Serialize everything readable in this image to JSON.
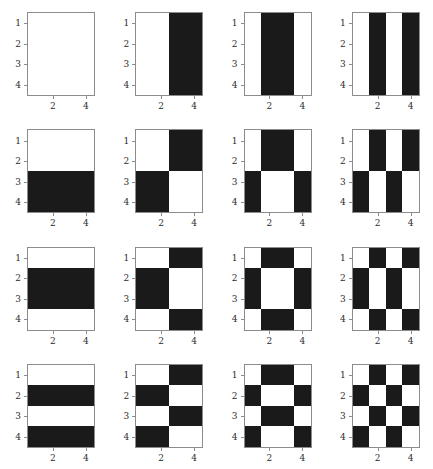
{
  "figure": {
    "title": "",
    "rows": 4,
    "cols": 4,
    "panel_count": 16,
    "colors": {
      "on": "#ffffff",
      "off": "#1a1a1a",
      "axis": "#8c8c8c",
      "text": "#2b2b2b",
      "background": "#ffffff"
    }
  },
  "axis": {
    "y_tick_values": [
      1,
      2,
      3,
      4
    ],
    "y_tick_labels": [
      "1",
      "2",
      "3",
      "4"
    ],
    "x_tick_values": [
      2,
      4
    ],
    "x_tick_labels": [
      "2",
      "4"
    ],
    "xlabel": "",
    "ylabel": "",
    "xlim": [
      0.5,
      4.5
    ],
    "ylim": [
      4.5,
      0.5
    ]
  },
  "chart_data": {
    "type": "heatmap",
    "title": "",
    "subtitle": "",
    "xlabel": "",
    "ylabel": "",
    "grid": false,
    "legend": null,
    "colormap": "binary (white = +1, black = -1)",
    "value_levels": [
      1,
      -1
    ],
    "row_index_labels": [
      "1",
      "2",
      "3",
      "4"
    ],
    "col_index_labels": [
      "1",
      "2",
      "3",
      "4"
    ],
    "basis_sequences": {
      "h1": [
        1,
        1,
        1,
        1
      ],
      "h2": [
        1,
        1,
        -1,
        -1
      ],
      "h3": [
        1,
        -1,
        -1,
        1
      ],
      "h4": [
        1,
        -1,
        1,
        -1
      ]
    },
    "panels": [
      {
        "row": 1,
        "col": 1,
        "row_sequence": [
          1,
          1,
          1,
          1
        ],
        "col_sequence": [
          1,
          1,
          1,
          1
        ],
        "matrix": [
          [
            1,
            1,
            1,
            1
          ],
          [
            1,
            1,
            1,
            1
          ],
          [
            1,
            1,
            1,
            1
          ],
          [
            1,
            1,
            1,
            1
          ]
        ]
      },
      {
        "row": 1,
        "col": 2,
        "row_sequence": [
          1,
          1,
          1,
          1
        ],
        "col_sequence": [
          1,
          1,
          -1,
          -1
        ],
        "matrix": [
          [
            1,
            1,
            -1,
            -1
          ],
          [
            1,
            1,
            -1,
            -1
          ],
          [
            1,
            1,
            -1,
            -1
          ],
          [
            1,
            1,
            -1,
            -1
          ]
        ]
      },
      {
        "row": 1,
        "col": 3,
        "row_sequence": [
          1,
          1,
          1,
          1
        ],
        "col_sequence": [
          1,
          -1,
          -1,
          1
        ],
        "matrix": [
          [
            1,
            -1,
            -1,
            1
          ],
          [
            1,
            -1,
            -1,
            1
          ],
          [
            1,
            -1,
            -1,
            1
          ],
          [
            1,
            -1,
            -1,
            1
          ]
        ]
      },
      {
        "row": 1,
        "col": 4,
        "row_sequence": [
          1,
          1,
          1,
          1
        ],
        "col_sequence": [
          1,
          -1,
          1,
          -1
        ],
        "matrix": [
          [
            1,
            -1,
            1,
            -1
          ],
          [
            1,
            -1,
            1,
            -1
          ],
          [
            1,
            -1,
            1,
            -1
          ],
          [
            1,
            -1,
            1,
            -1
          ]
        ]
      },
      {
        "row": 2,
        "col": 1,
        "row_sequence": [
          1,
          1,
          -1,
          -1
        ],
        "col_sequence": [
          1,
          1,
          1,
          1
        ],
        "matrix": [
          [
            1,
            1,
            1,
            1
          ],
          [
            1,
            1,
            1,
            1
          ],
          [
            -1,
            -1,
            -1,
            -1
          ],
          [
            -1,
            -1,
            -1,
            -1
          ]
        ]
      },
      {
        "row": 2,
        "col": 2,
        "row_sequence": [
          1,
          1,
          -1,
          -1
        ],
        "col_sequence": [
          1,
          1,
          -1,
          -1
        ],
        "matrix": [
          [
            1,
            1,
            -1,
            -1
          ],
          [
            1,
            1,
            -1,
            -1
          ],
          [
            -1,
            -1,
            1,
            1
          ],
          [
            -1,
            -1,
            1,
            1
          ]
        ]
      },
      {
        "row": 2,
        "col": 3,
        "row_sequence": [
          1,
          1,
          -1,
          -1
        ],
        "col_sequence": [
          1,
          -1,
          -1,
          1
        ],
        "matrix": [
          [
            1,
            -1,
            -1,
            1
          ],
          [
            1,
            -1,
            -1,
            1
          ],
          [
            -1,
            1,
            1,
            -1
          ],
          [
            -1,
            1,
            1,
            -1
          ]
        ]
      },
      {
        "row": 2,
        "col": 4,
        "row_sequence": [
          1,
          1,
          -1,
          -1
        ],
        "col_sequence": [
          1,
          -1,
          1,
          -1
        ],
        "matrix": [
          [
            1,
            -1,
            1,
            -1
          ],
          [
            1,
            -1,
            1,
            -1
          ],
          [
            -1,
            1,
            -1,
            1
          ],
          [
            -1,
            1,
            -1,
            1
          ]
        ]
      },
      {
        "row": 3,
        "col": 1,
        "row_sequence": [
          1,
          -1,
          -1,
          1
        ],
        "col_sequence": [
          1,
          1,
          1,
          1
        ],
        "matrix": [
          [
            1,
            1,
            1,
            1
          ],
          [
            -1,
            -1,
            -1,
            -1
          ],
          [
            -1,
            -1,
            -1,
            -1
          ],
          [
            1,
            1,
            1,
            1
          ]
        ]
      },
      {
        "row": 3,
        "col": 2,
        "row_sequence": [
          1,
          -1,
          -1,
          1
        ],
        "col_sequence": [
          1,
          1,
          -1,
          -1
        ],
        "matrix": [
          [
            1,
            1,
            -1,
            -1
          ],
          [
            -1,
            -1,
            1,
            1
          ],
          [
            -1,
            -1,
            1,
            1
          ],
          [
            1,
            1,
            -1,
            -1
          ]
        ]
      },
      {
        "row": 3,
        "col": 3,
        "row_sequence": [
          1,
          -1,
          -1,
          1
        ],
        "col_sequence": [
          1,
          -1,
          -1,
          1
        ],
        "matrix": [
          [
            1,
            -1,
            -1,
            1
          ],
          [
            -1,
            1,
            1,
            -1
          ],
          [
            -1,
            1,
            1,
            -1
          ],
          [
            1,
            -1,
            -1,
            1
          ]
        ]
      },
      {
        "row": 3,
        "col": 4,
        "row_sequence": [
          1,
          -1,
          -1,
          1
        ],
        "col_sequence": [
          1,
          -1,
          1,
          -1
        ],
        "matrix": [
          [
            1,
            -1,
            1,
            -1
          ],
          [
            -1,
            1,
            -1,
            1
          ],
          [
            -1,
            1,
            -1,
            1
          ],
          [
            1,
            -1,
            1,
            -1
          ]
        ]
      },
      {
        "row": 4,
        "col": 1,
        "row_sequence": [
          1,
          -1,
          1,
          -1
        ],
        "col_sequence": [
          1,
          1,
          1,
          1
        ],
        "matrix": [
          [
            1,
            1,
            1,
            1
          ],
          [
            -1,
            -1,
            -1,
            -1
          ],
          [
            1,
            1,
            1,
            1
          ],
          [
            -1,
            -1,
            -1,
            -1
          ]
        ]
      },
      {
        "row": 4,
        "col": 2,
        "row_sequence": [
          1,
          -1,
          1,
          -1
        ],
        "col_sequence": [
          1,
          1,
          -1,
          -1
        ],
        "matrix": [
          [
            1,
            1,
            -1,
            -1
          ],
          [
            -1,
            -1,
            1,
            1
          ],
          [
            1,
            1,
            -1,
            -1
          ],
          [
            -1,
            -1,
            1,
            1
          ]
        ]
      },
      {
        "row": 4,
        "col": 3,
        "row_sequence": [
          1,
          -1,
          1,
          -1
        ],
        "col_sequence": [
          1,
          -1,
          -1,
          1
        ],
        "matrix": [
          [
            1,
            -1,
            -1,
            1
          ],
          [
            -1,
            1,
            1,
            -1
          ],
          [
            1,
            -1,
            -1,
            1
          ],
          [
            -1,
            1,
            1,
            -1
          ]
        ]
      },
      {
        "row": 4,
        "col": 4,
        "row_sequence": [
          1,
          -1,
          1,
          -1
        ],
        "col_sequence": [
          1,
          -1,
          1,
          -1
        ],
        "matrix": [
          [
            1,
            -1,
            1,
            -1
          ],
          [
            -1,
            1,
            -1,
            1
          ],
          [
            1,
            -1,
            1,
            -1
          ],
          [
            -1,
            1,
            -1,
            1
          ]
        ]
      }
    ]
  }
}
